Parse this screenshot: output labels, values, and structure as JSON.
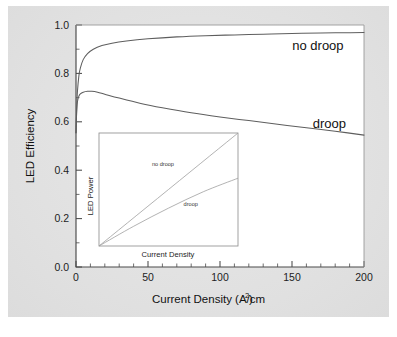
{
  "chart_data": {
    "type": "line",
    "title": "",
    "xlabel": "Current Density (A/cm",
    "xlabel_sup": "2",
    "xlabel_tail": ")",
    "ylabel": "LED Efficiency",
    "xlim": [
      0,
      200
    ],
    "ylim": [
      0.0,
      1.0
    ],
    "xticks": [
      0,
      50,
      100,
      150,
      200
    ],
    "xtick_labels": [
      "0",
      "50",
      "100",
      "150",
      "200"
    ],
    "yticks": [
      0.0,
      0.2,
      0.4,
      0.6,
      0.8,
      1.0
    ],
    "ytick_labels": [
      "0.0",
      "0.2",
      "0.4",
      "0.6",
      "0.8",
      "1.0"
    ],
    "x_minor_step": 10,
    "y_minor_step": 0.1,
    "grid": false,
    "legend": "inline-annotations",
    "annotations": [
      {
        "text": "no droop",
        "x": 168,
        "y": 0.895
      },
      {
        "text": "droop",
        "x": 176,
        "y": 0.575
      }
    ],
    "series": [
      {
        "name": "no droop",
        "x": [
          0,
          0.5,
          1,
          2,
          3,
          5,
          8,
          12,
          18,
          25,
          35,
          50,
          70,
          90,
          110,
          130,
          150,
          170,
          185,
          200
        ],
        "values": [
          0.555,
          0.66,
          0.725,
          0.79,
          0.822,
          0.857,
          0.882,
          0.9,
          0.915,
          0.925,
          0.934,
          0.943,
          0.951,
          0.956,
          0.959,
          0.962,
          0.965,
          0.967,
          0.968,
          0.969
        ]
      },
      {
        "name": "droop",
        "x": [
          0,
          0.5,
          1,
          2,
          3,
          5,
          8,
          11,
          15,
          20,
          30,
          45,
          60,
          80,
          100,
          120,
          140,
          160,
          180,
          200
        ],
        "values": [
          0.555,
          0.645,
          0.683,
          0.706,
          0.715,
          0.722,
          0.726,
          0.726,
          0.722,
          0.714,
          0.698,
          0.676,
          0.658,
          0.637,
          0.62,
          0.605,
          0.59,
          0.575,
          0.561,
          0.545
        ]
      }
    ],
    "inset": {
      "type": "line",
      "xlabel": "Current Density",
      "ylabel": "LED Power",
      "xlim": [
        0,
        1
      ],
      "ylim": [
        0,
        1
      ],
      "grid": false,
      "annotations": [
        {
          "text": "no droop",
          "x": 0.46,
          "y": 0.71
        },
        {
          "text": "droop",
          "x": 0.66,
          "y": 0.35
        }
      ],
      "series": [
        {
          "name": "no droop",
          "x": [
            0.0,
            1.0
          ],
          "values": [
            0.0,
            1.0
          ]
        },
        {
          "name": "droop",
          "x": [
            0.0,
            0.25,
            0.5,
            0.75,
            1.0
          ],
          "values": [
            0.0,
            0.175,
            0.335,
            0.48,
            0.6
          ]
        }
      ]
    },
    "colors": {
      "background": "#e3e3e3",
      "plot_background": "#ffffff",
      "axis": "#4a4a4a",
      "curve": "#5e5e5e",
      "inset_curve": "#a0a0a0",
      "text": "#111111"
    }
  }
}
